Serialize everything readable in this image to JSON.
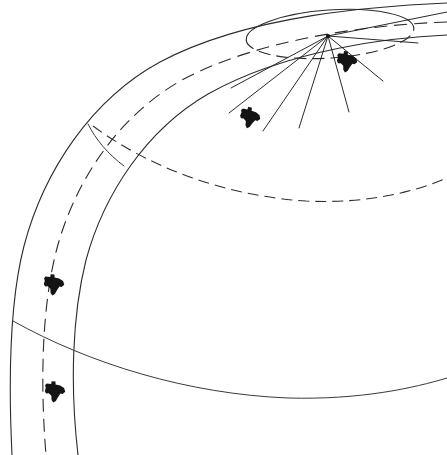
{
  "figure": {
    "title": "Curved track band diagram with radial sector lines and Texas state markers",
    "background_color": "#ffffff",
    "ink_color": "#2b2b2b",
    "marker_color": "#141414",
    "width": 447,
    "height": 455,
    "caption": ""
  },
  "chart_data": {
    "type": "line",
    "title": "Curved track band diagram with radial sector lines and Texas state markers",
    "xlabel": "",
    "ylabel": "",
    "xlim": [
      0,
      447
    ],
    "ylim": [
      455,
      0
    ],
    "grid": false,
    "legend": "none",
    "coordinate_note": "All coordinates in image pixel space, origin top-left.",
    "vertex": {
      "name": "radial-origin",
      "x": 328,
      "y": 36
    },
    "ellipse": {
      "name": "apex-ellipse",
      "cx": 330,
      "cy": 34,
      "rx": 84,
      "ry": 24,
      "rotation_deg": -4,
      "style": "solid-with-dashed-lower-arc"
    },
    "series": [
      {
        "name": "outer-band-arc",
        "style": "solid",
        "path": "M 447 3 C 380 6, 250 14, 160 62 C 92 99, 44 170, 24 246 C 10 300, 8 372, 12 455"
      },
      {
        "name": "middle-band-arc",
        "style": "dashed",
        "dash": "13 7",
        "path": "M 447 22 C 390 24, 268 34, 182 80 C 118 116, 74 182, 56 252 C 42 308, 40 382, 46 455"
      },
      {
        "name": "inner-band-arc",
        "style": "solid",
        "path": "M 447 35 C 398 37, 290 48, 208 94 C 146 130, 104 194, 86 260 C 72 316, 70 386, 78 455"
      },
      {
        "name": "mid-sweep-dashed-arc",
        "style": "dashed",
        "dash": "11 6",
        "path": "M 93 126 C 150 168, 226 196, 306 201 C 366 204, 414 192, 447 178"
      },
      {
        "name": "lower-sweep-solid-arc",
        "style": "solid",
        "path": "M 13 321 C 90 364, 188 394, 288 398 C 360 400, 414 388, 447 378"
      },
      {
        "name": "band-cross-tick",
        "style": "solid",
        "path": "M 88 124 C 96 140, 108 154, 124 166"
      }
    ],
    "radial_lines": [
      {
        "name": "ray-1",
        "x1": 328,
        "y1": 36,
        "x2": 231,
        "y2": 88
      },
      {
        "name": "ray-2",
        "x1": 328,
        "y1": 36,
        "x2": 229,
        "y2": 113
      },
      {
        "name": "ray-3",
        "x1": 328,
        "y1": 36,
        "x2": 263,
        "y2": 131
      },
      {
        "name": "ray-4",
        "x1": 328,
        "y1": 36,
        "x2": 299,
        "y2": 128
      },
      {
        "name": "ray-5",
        "x1": 328,
        "y1": 36,
        "x2": 349,
        "y2": 112
      },
      {
        "name": "ray-6",
        "x1": 328,
        "y1": 36,
        "x2": 383,
        "y2": 81
      },
      {
        "name": "ray-7",
        "x1": 328,
        "y1": 36,
        "x2": 418,
        "y2": 43
      },
      {
        "name": "ray-8-upper",
        "x1": 328,
        "y1": 36,
        "x2": 447,
        "y2": 12
      }
    ],
    "markers": [
      {
        "name": "texas-marker-upper-right",
        "label": "Texas",
        "x": 347,
        "y": 62,
        "scale": 1.0,
        "rotation_deg": 8
      },
      {
        "name": "texas-marker-mid-left",
        "label": "Texas",
        "x": 250,
        "y": 118,
        "scale": 1.0,
        "rotation_deg": 14
      },
      {
        "name": "texas-marker-lower-band",
        "label": "Texas",
        "x": 54,
        "y": 285,
        "scale": 1.0,
        "rotation_deg": 6
      },
      {
        "name": "texas-marker-bottom-band",
        "label": "Texas",
        "x": 55,
        "y": 392,
        "scale": 1.0,
        "rotation_deg": 6
      }
    ],
    "marker_shape": {
      "name": "texas-silhouette",
      "path": "M -9.2 -7.6 L -4.6 -7.6 L -4.4 -10.4 L -0.6 -10.4 L -0.2 -7.4 L 4.4 -7.0 L 8.6 -5.0 L 10.2 -1.4 L 7.8 1.2 L 5.6 1.0 L 3.6 4.6 L 1.8 8.8 L -0.6 10.6 L -2.6 8.2 L -3.2 4.2 L -6.0 2.0 L -8.6 2.4 L -10.2 0.2 L -9.6 -3.2 L -10.6 -5.6 Z"
    }
  }
}
